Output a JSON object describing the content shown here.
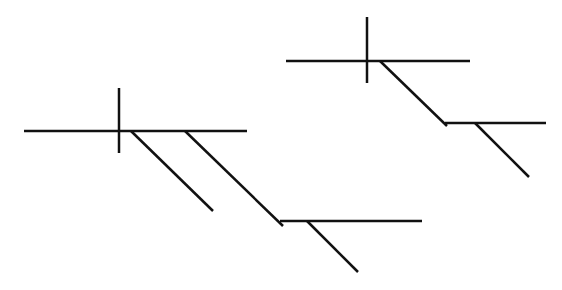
{
  "diagram": {
    "type": "sentence-diagram",
    "style": {
      "background": "#ffffff",
      "stroke": "#111111",
      "stroke_width": 2.5
    },
    "left_diagram": {
      "baseline": {
        "x1": 24,
        "y1": 131,
        "x2": 247,
        "y2": 131
      },
      "subject_predicate_divider": {
        "x1": 119,
        "y1": 88,
        "x2": 119,
        "y2": 153
      },
      "modifier_slant_1": {
        "x1": 131,
        "y1": 131,
        "x2": 213,
        "y2": 211
      },
      "modifier_slant_2": {
        "x1": 185,
        "y1": 131,
        "x2": 283,
        "y2": 226
      },
      "sub_baseline": {
        "x1": 280,
        "y1": 221,
        "x2": 422,
        "y2": 221
      },
      "sub_slant": {
        "x1": 307,
        "y1": 221,
        "x2": 358,
        "y2": 272
      }
    },
    "right_diagram": {
      "baseline": {
        "x1": 286,
        "y1": 61,
        "x2": 470,
        "y2": 61
      },
      "subject_predicate_divider": {
        "x1": 367,
        "y1": 17,
        "x2": 367,
        "y2": 83
      },
      "modifier_slant": {
        "x1": 380,
        "y1": 61,
        "x2": 447,
        "y2": 126
      },
      "sub_baseline": {
        "x1": 445,
        "y1": 123,
        "x2": 546,
        "y2": 123
      },
      "sub_slant": {
        "x1": 475,
        "y1": 123,
        "x2": 529,
        "y2": 177
      }
    }
  }
}
